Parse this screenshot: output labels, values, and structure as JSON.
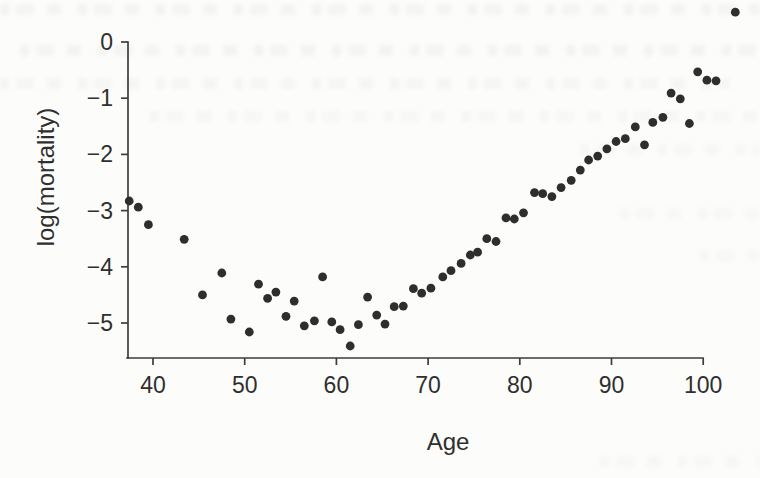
{
  "figure": {
    "kind": "scanned textbook scatter plot",
    "background_color": "#fcfcfa",
    "ink_color": "#2e2e2e",
    "axis_color": "#3d3d3d"
  },
  "chart_data": {
    "type": "scatter",
    "title": "",
    "xlabel": "Age",
    "ylabel": "log(mortality)",
    "xlim": [
      36.5,
      104.5
    ],
    "ylim": [
      -5.6,
      0.6
    ],
    "grid": false,
    "legend": null,
    "marker": "filled-circle",
    "x_ticks": [
      40,
      50,
      60,
      70,
      80,
      90,
      100
    ],
    "x_tick_labels": [
      "40",
      "50",
      "60",
      "70",
      "80",
      "90",
      "100"
    ],
    "y_ticks": [
      0,
      -1,
      -2,
      -3,
      -4,
      -5
    ],
    "y_tick_labels": [
      "0",
      "−1",
      "−2",
      "−3",
      "−4",
      "−5"
    ],
    "points": [
      [
        37.4,
        -2.83
      ],
      [
        38.4,
        -2.94
      ],
      [
        39.5,
        -3.25
      ],
      [
        43.4,
        -3.51
      ],
      [
        45.4,
        -4.5
      ],
      [
        47.5,
        -4.11
      ],
      [
        48.5,
        -4.93
      ],
      [
        50.5,
        -5.16
      ],
      [
        51.5,
        -4.31
      ],
      [
        52.5,
        -4.56
      ],
      [
        53.4,
        -4.45
      ],
      [
        54.5,
        -4.88
      ],
      [
        55.4,
        -4.61
      ],
      [
        56.5,
        -5.05
      ],
      [
        57.6,
        -4.96
      ],
      [
        58.5,
        -4.18
      ],
      [
        59.5,
        -4.98
      ],
      [
        60.4,
        -5.12
      ],
      [
        61.5,
        -5.41
      ],
      [
        62.4,
        -5.03
      ],
      [
        63.4,
        -4.54
      ],
      [
        64.4,
        -4.86
      ],
      [
        65.3,
        -5.02
      ],
      [
        66.3,
        -4.71
      ],
      [
        67.3,
        -4.7
      ],
      [
        68.4,
        -4.39
      ],
      [
        69.3,
        -4.47
      ],
      [
        70.3,
        -4.38
      ],
      [
        71.6,
        -4.18
      ],
      [
        72.5,
        -4.07
      ],
      [
        73.6,
        -3.94
      ],
      [
        74.6,
        -3.79
      ],
      [
        75.4,
        -3.74
      ],
      [
        76.4,
        -3.5
      ],
      [
        77.4,
        -3.55
      ],
      [
        78.5,
        -3.13
      ],
      [
        79.4,
        -3.15
      ],
      [
        80.4,
        -3.04
      ],
      [
        81.6,
        -2.68
      ],
      [
        82.5,
        -2.7
      ],
      [
        83.5,
        -2.75
      ],
      [
        84.5,
        -2.59
      ],
      [
        85.6,
        -2.46
      ],
      [
        86.6,
        -2.28
      ],
      [
        87.5,
        -2.1
      ],
      [
        88.5,
        -2.03
      ],
      [
        89.5,
        -1.9
      ],
      [
        90.5,
        -1.77
      ],
      [
        91.5,
        -1.72
      ],
      [
        92.6,
        -1.51
      ],
      [
        93.6,
        -1.83
      ],
      [
        94.5,
        -1.43
      ],
      [
        95.6,
        -1.34
      ],
      [
        96.5,
        -0.91
      ],
      [
        97.5,
        -1.01
      ],
      [
        98.5,
        -1.45
      ],
      [
        99.4,
        -0.53
      ],
      [
        100.4,
        -0.68
      ],
      [
        101.4,
        -0.69
      ],
      [
        103.5,
        0.53
      ]
    ]
  }
}
